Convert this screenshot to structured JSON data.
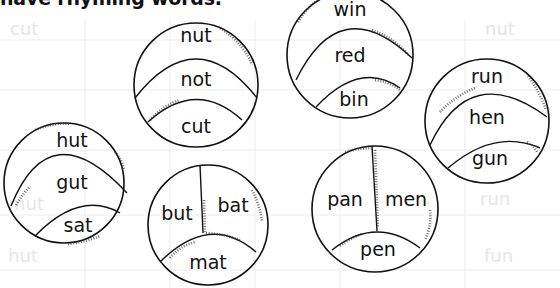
{
  "instruction": {
    "text": "have rhyming words."
  },
  "background_table": {
    "faint_words": [
      "cut",
      "nut",
      "bat",
      "gun",
      "mut",
      "hut",
      "run",
      "fun"
    ]
  },
  "circles": [
    {
      "id": "c1",
      "words": [
        "nut",
        "not",
        "cut"
      ],
      "layout": "three-bands"
    },
    {
      "id": "c2",
      "words": [
        "win",
        "red",
        "bin"
      ],
      "layout": "three-bands"
    },
    {
      "id": "c3",
      "words": [
        "hut",
        "gut",
        "sat"
      ],
      "layout": "three-bands"
    },
    {
      "id": "c4",
      "words": [
        "but",
        "bat",
        "mat"
      ],
      "layout": "split-top"
    },
    {
      "id": "c5",
      "words": [
        "pan",
        "men",
        "pen"
      ],
      "layout": "split-top"
    },
    {
      "id": "c6",
      "words": [
        "run",
        "hen",
        "gun"
      ],
      "layout": "three-bands"
    }
  ]
}
